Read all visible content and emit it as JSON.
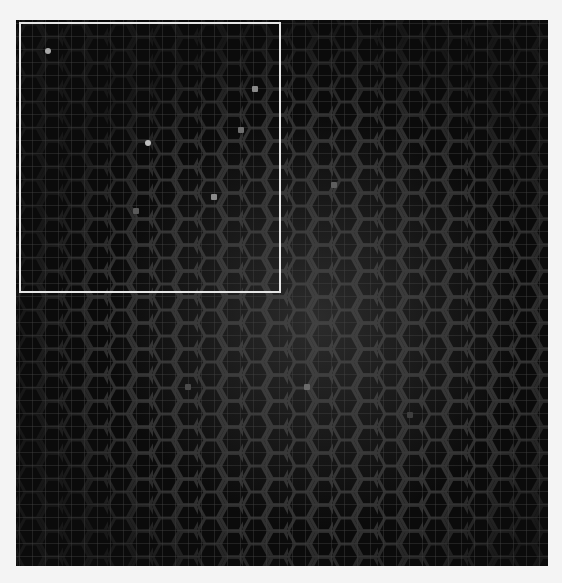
{
  "board": {
    "background": "#0b0b0b",
    "grid_color": "#3a3a3a",
    "hex_color": "#3c3c3c",
    "selection": {
      "x": 3,
      "y": 2,
      "width": 262,
      "height": 271,
      "color": "#e6e6e6"
    },
    "points": [
      {
        "x": 32,
        "y": 31,
        "color": "#a8a8a8",
        "round": true
      },
      {
        "x": 132,
        "y": 123,
        "color": "#bdbdbd",
        "round": true
      },
      {
        "x": 239,
        "y": 69,
        "color": "#8a8a8a"
      },
      {
        "x": 225,
        "y": 110,
        "color": "#6e6e6e"
      },
      {
        "x": 198,
        "y": 177,
        "color": "#8a8a8a"
      },
      {
        "x": 120,
        "y": 191,
        "color": "#5a5a5a"
      },
      {
        "x": 318,
        "y": 165,
        "color": "#5e5e5e"
      },
      {
        "x": 291,
        "y": 367,
        "color": "#6a6a6a"
      },
      {
        "x": 172,
        "y": 367,
        "color": "#4a4a4a"
      },
      {
        "x": 394,
        "y": 395,
        "color": "#3e3e3e"
      }
    ]
  }
}
